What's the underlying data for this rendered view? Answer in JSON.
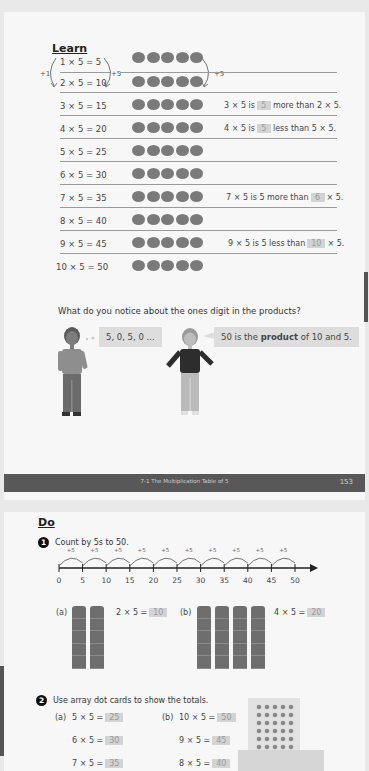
{
  "page1": {
    "heading": "Learn",
    "rows": [
      {
        "eq": "1 × 5 = 5"
      },
      {
        "eq": "2 × 5 = 10"
      },
      {
        "eq": "3 × 5 = 15",
        "note": {
          "pre": "3 × 5 is",
          "box": "5",
          "post": "more than 2 × 5."
        }
      },
      {
        "eq": "4 × 5 = 20",
        "note": {
          "pre": "4 × 5 is",
          "box": "5",
          "post": "less than 5 × 5."
        }
      },
      {
        "eq": "5 × 5 = 25"
      },
      {
        "eq": "6 × 5 = 30"
      },
      {
        "eq": "7 × 5 = 35",
        "note": {
          "pre": "7 × 5 is 5 more than",
          "box": "6",
          "post": "× 5."
        }
      },
      {
        "eq": "8 × 5 = 40"
      },
      {
        "eq": "9 × 5 = 45",
        "note": {
          "pre": "9 × 5 is 5 less than",
          "box": "10",
          "post": "× 5."
        }
      },
      {
        "eq": "10 × 5 = 50"
      }
    ],
    "arrows": {
      "left": "+1",
      "middle": "+5",
      "right": "+5"
    },
    "question": "What do you notice about the ones digit in the products?",
    "bubble_boy": "5, 0, 5, 0 ...",
    "bubble_girl": {
      "pre": "50 is the ",
      "bold": "product",
      "post": " of 10 and 5."
    },
    "footer": {
      "title": "7-1  The Multiplication Table of 5",
      "page_number": "153"
    }
  },
  "page2": {
    "heading": "Do",
    "q1": {
      "number": "1",
      "text": "Count by 5s to 50.",
      "ticks": [
        "0",
        "5",
        "10",
        "15",
        "20",
        "25",
        "30",
        "35",
        "40",
        "45",
        "50"
      ],
      "jump_label": "+5",
      "a": {
        "label": "(a)",
        "eq": "2 × 5 =",
        "answer": "10"
      },
      "b": {
        "label": "(b)",
        "eq": "4 × 5 =",
        "answer": "20"
      }
    },
    "q2": {
      "number": "2",
      "text": "Use array dot cards to show the totals.",
      "a_label": "(a)",
      "b_label": "(b)",
      "a": [
        {
          "eq": "5 × 5 =",
          "answer": "25"
        },
        {
          "eq": "6 × 5 =",
          "answer": "30"
        },
        {
          "eq": "7 × 5 =",
          "answer": "35"
        }
      ],
      "b": [
        {
          "eq": "10 × 5 =",
          "answer": "50"
        },
        {
          "eq": "9 × 5 =",
          "answer": "45"
        },
        {
          "eq": "8 × 5 =",
          "answer": "40"
        }
      ]
    }
  },
  "colors": {
    "background": "#e9e9e9",
    "page": "#f7f7f7",
    "footer": "#585858",
    "answer_box": "#d3d3d3",
    "dot": "#7a7a7a"
  }
}
